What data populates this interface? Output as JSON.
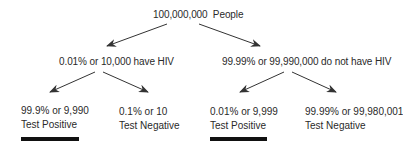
{
  "diagram": {
    "root": {
      "label": "100,000,000  People"
    },
    "level2": [
      {
        "label": "0.01% or 10,000 have HIV"
      },
      {
        "label": "99.99% or 99,990,000 do not have HIV"
      }
    ],
    "leaves": [
      {
        "line1": "99.9% or 9,990",
        "line2": "Test Positive",
        "underlined": true
      },
      {
        "line1": "0.1% or 10",
        "line2": "Test Negative",
        "underlined": false
      },
      {
        "line1": "0.01% or 9,999",
        "line2": "Test Positive",
        "underlined": true
      },
      {
        "line1": "99.99% or 99,980,001",
        "line2": "Test Negative",
        "underlined": false
      }
    ],
    "colors": {
      "text": "#2a2a2a",
      "arrow": "#333333",
      "bar": "#111111",
      "background": "#ffffff"
    }
  }
}
